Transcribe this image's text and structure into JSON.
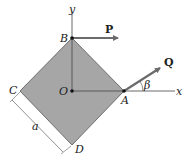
{
  "diagram": {
    "colors": {
      "plate_fill": "#a6a6a6",
      "plate_stroke": "#555555",
      "axis": "#444444",
      "force_arrow": "#6b6b6b",
      "point": "#111111"
    },
    "points": {
      "B": {
        "label": "B",
        "x": 72,
        "y": 38
      },
      "O": {
        "label": "O",
        "x": 72,
        "y": 91
      },
      "A": {
        "label": "A",
        "x": 124,
        "y": 91
      },
      "C": {
        "label": "C",
        "x": 20,
        "y": 91
      },
      "D": {
        "label": "D",
        "x": 72,
        "y": 145
      }
    },
    "axes": {
      "x_label": "x",
      "y_label": "y"
    },
    "forces": {
      "P": {
        "label": "P",
        "from": "B",
        "direction": "horizontal-right"
      },
      "Q": {
        "label": "Q",
        "from": "A",
        "angle_label": "β"
      }
    },
    "dimension": {
      "label": "a",
      "edge": "C-D"
    }
  }
}
